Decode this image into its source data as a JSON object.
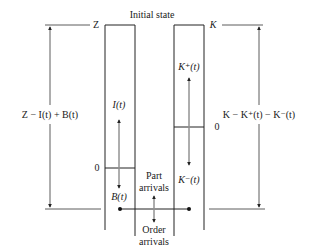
{
  "diagram": {
    "title": "Initial state",
    "left_column": {
      "top_label": "Z",
      "zero_label": "0",
      "up_label": "I(t)",
      "down_label": "B(t)",
      "side_label": "Z − I(t) + B(t)"
    },
    "right_column": {
      "top_label": "K",
      "zero_label": "0",
      "up_label": "K⁺(t)",
      "down_label": "K⁻(t)",
      "side_label": "K − K⁺(t) − K⁻(t)"
    },
    "center": {
      "part_arrivals": [
        "Part",
        "arrivals"
      ],
      "order_arrivals": [
        "Order",
        "arrivals"
      ]
    }
  }
}
